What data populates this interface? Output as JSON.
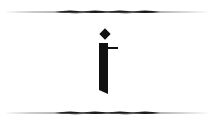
{
  "glyph": {
    "letter": "i",
    "label": "Decorative letter i",
    "color": "#111111"
  },
  "ornaments": {
    "top_label": "top-swirl-divider",
    "bottom_label": "bottom-swirl-divider",
    "color": "#1a1a1a"
  },
  "background": "#ffffff"
}
